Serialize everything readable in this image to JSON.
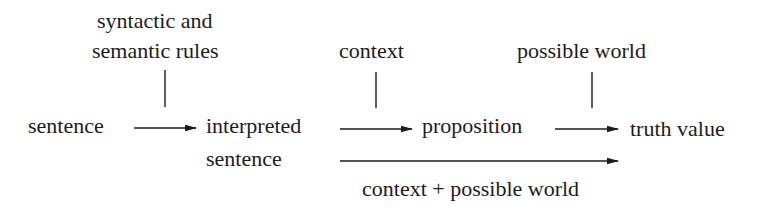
{
  "diagram": {
    "type": "flow",
    "nodes": {
      "sentence": "sentence",
      "interpreted_line1": "interpreted",
      "interpreted_line2": "sentence",
      "proposition": "proposition",
      "truth_value": "truth value"
    },
    "inputs": {
      "rules_line1": "syntactic and",
      "rules_line2": "semantic rules",
      "context": "context",
      "possible_world": "possible world"
    },
    "edges": [
      {
        "from": "sentence",
        "to": "interpreted sentence",
        "input": "syntactic and semantic rules"
      },
      {
        "from": "interpreted sentence",
        "to": "proposition",
        "input": "context"
      },
      {
        "from": "proposition",
        "to": "truth value",
        "input": "possible world"
      },
      {
        "from": "interpreted sentence",
        "to": "truth value",
        "label": "context + possible world"
      }
    ],
    "bottom_label": "context + possible world",
    "colors": {
      "ink": "#1c1c1c",
      "background": "#ffffff"
    }
  }
}
